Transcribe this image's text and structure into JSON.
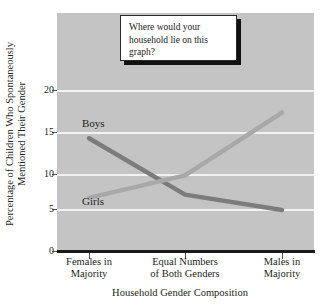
{
  "chart_data": {
    "type": "line",
    "title": "",
    "xlabel": "Household Gender Composition",
    "ylabel": "Percentage of Children Who Spontaneously Mentioned Their Gender",
    "ylabel_line1": "Percentage of Children Who Spontaneously",
    "ylabel_line2": "Mentioned Their Gender",
    "categories": [
      "Females in Majority",
      "Equal Numbers of Both Genders",
      "Males in Majority"
    ],
    "category_lines": [
      [
        "Females in",
        "Majority"
      ],
      [
        "Equal Numbers",
        "of Both Genders"
      ],
      [
        "Males in",
        "Majority"
      ]
    ],
    "series": [
      {
        "name": "Boys",
        "values": [
          14.0,
          7.0,
          5.1
        ],
        "color": "#7c7c7c"
      },
      {
        "name": "Girls",
        "values": [
          6.6,
          9.4,
          17.2
        ],
        "color": "#a8a8a8"
      }
    ],
    "ylim": [
      0,
      23
    ],
    "yticks": [
      0,
      5,
      10,
      15,
      20
    ],
    "ytick_labels": [
      "0",
      "5",
      "10",
      "15",
      "20"
    ],
    "grid": true,
    "gridline_color": "#f2f2f2",
    "plot_background": "#c4c4c4",
    "legend_position": "inline-labels"
  },
  "callout": {
    "text": "Where would your household lie on this graph?"
  }
}
